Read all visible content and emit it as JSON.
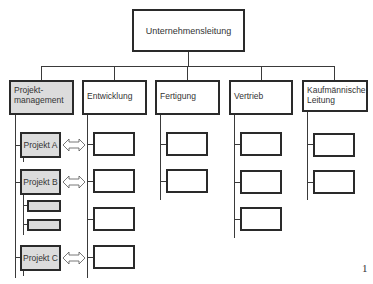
{
  "diagram": {
    "type": "org-chart",
    "root": {
      "label": "Unternehmensleitung"
    },
    "departments": [
      {
        "label": "Projekt-\nmanagement",
        "line1": "Projekt-",
        "line2": "management",
        "highlighted": true
      },
      {
        "label": "Entwicklung",
        "children": 4
      },
      {
        "label": "Fertigung",
        "children": 2
      },
      {
        "label": "Vertrieb",
        "children": 3
      },
      {
        "label": "Kaufmännische Leitung",
        "line1": "Kaufmännische",
        "line2": "Leitung",
        "children": 2
      }
    ],
    "projects": [
      {
        "label": "Projekt A",
        "subunits": 0,
        "linked_to": "Entwicklung"
      },
      {
        "label": "Projekt B",
        "subunits": 2,
        "linked_to": "Entwicklung"
      },
      {
        "label": "Projekt C",
        "subunits": 0,
        "linked_to": "Entwicklung"
      }
    ],
    "relation_symbol": "double-headed-arrow",
    "page_number": "1"
  },
  "colors": {
    "line": "#2a2a2a",
    "highlight_fill": "#dcdcdc",
    "background": "#ffffff"
  }
}
